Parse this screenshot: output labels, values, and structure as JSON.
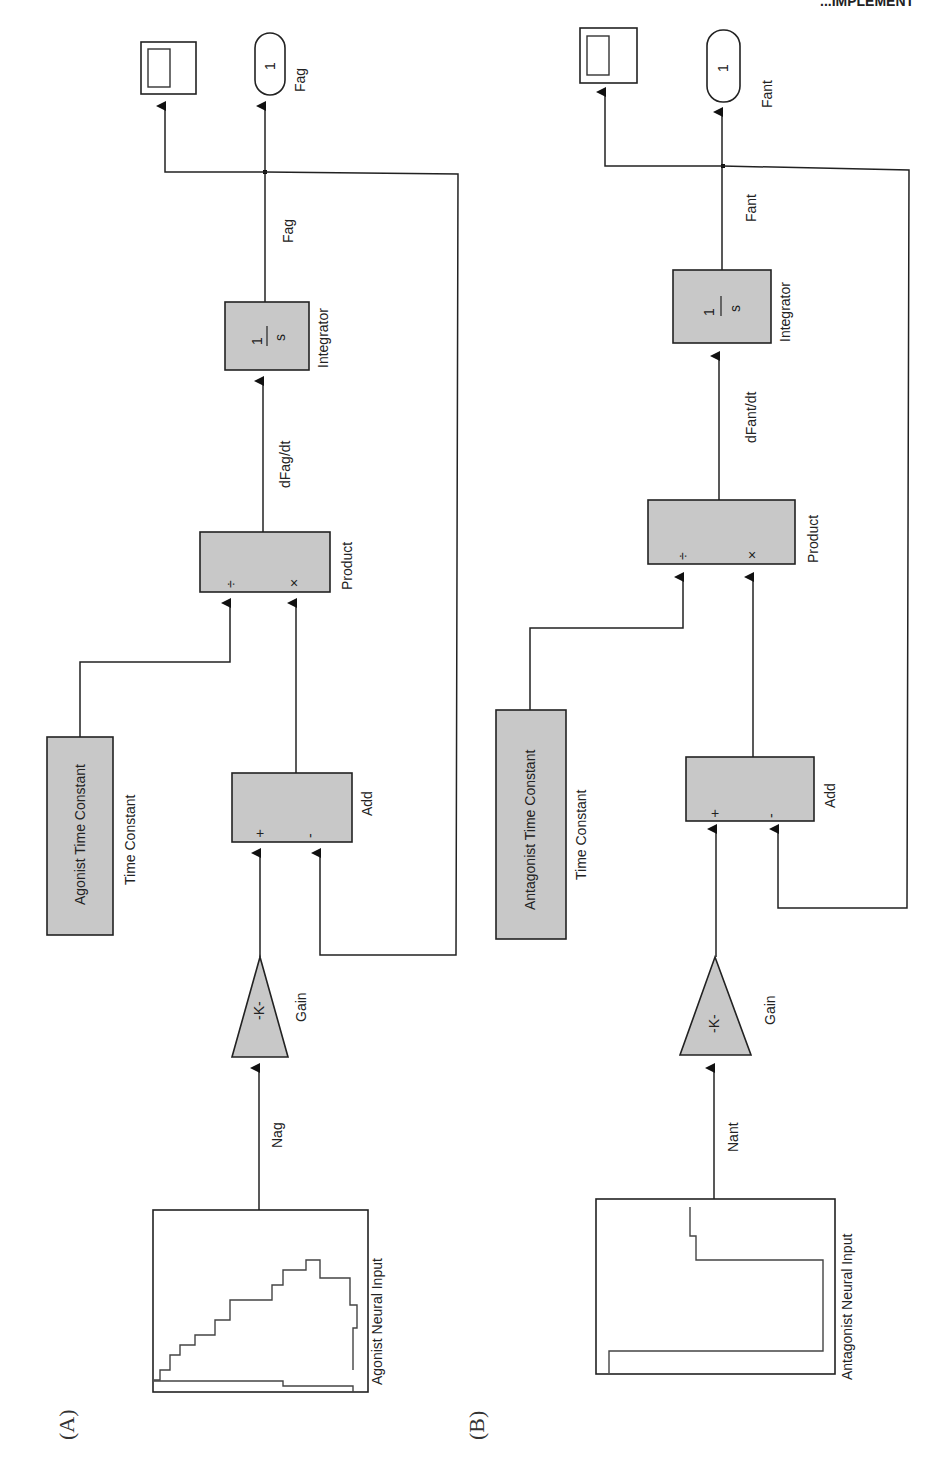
{
  "header_fragment": "...IMPLEMENT",
  "panels": [
    {
      "id": "A",
      "panel_label": "(A)",
      "source": {
        "name": "Agonist Neural Input",
        "signal": "Nag"
      },
      "gain": {
        "name": "Gain",
        "symbol": "-K-"
      },
      "add": {
        "name": "Add",
        "signs": [
          "+",
          "-"
        ]
      },
      "time_constant": {
        "block_text": "Agonist Time Constant",
        "name": "Time Constant"
      },
      "product": {
        "name": "Product",
        "ports": [
          "÷",
          "×"
        ],
        "output_signal": "dFag/dt"
      },
      "integrator": {
        "name": "Integrator",
        "numerator": "1",
        "denominator": "s",
        "output_signal": "Fag"
      },
      "outport": {
        "number": "1",
        "name": "Fag"
      },
      "scope": {
        "name": "Scope"
      }
    },
    {
      "id": "B",
      "panel_label": "(B)",
      "source": {
        "name": "Antagonist Neural Input",
        "signal": "Nant"
      },
      "gain": {
        "name": "Gain",
        "symbol": "-K-"
      },
      "add": {
        "name": "Add",
        "signs": [
          "+",
          "-"
        ]
      },
      "time_constant": {
        "block_text": "Antagonist Time Constant",
        "name": "Time Constant"
      },
      "product": {
        "name": "Product",
        "ports": [
          "÷",
          "×"
        ],
        "output_signal": "dFant/dt"
      },
      "integrator": {
        "name": "Integrator",
        "numerator": "1",
        "denominator": "s",
        "output_signal": "Fant"
      },
      "outport": {
        "number": "1",
        "name": "Fant"
      },
      "scope": {
        "name": "Scope"
      }
    }
  ]
}
